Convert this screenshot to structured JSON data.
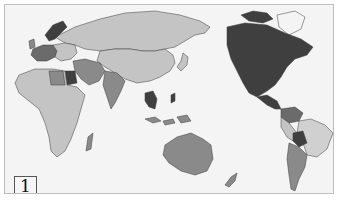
{
  "map": {
    "panel_label": "1",
    "projection": "pacific-centered world map",
    "legend": null,
    "colors": {
      "ocean": "#f4f4f4",
      "light": "#c4c4c4",
      "lighter": "#d0d0d0",
      "medium": "#8a8a8a",
      "medium_dark": "#6b6b6b",
      "dark": "#3f3f3f",
      "border": "#3a3a3a"
    },
    "regions": [
      {
        "name": "North America (Canada, USA, Mexico)",
        "shade": "dark"
      },
      {
        "name": "Greenland",
        "shade": "ocean"
      },
      {
        "name": "Central America",
        "shade": "dark"
      },
      {
        "name": "Colombia / Venezuela",
        "shade": "medium_dark"
      },
      {
        "name": "Brazil",
        "shade": "lighter"
      },
      {
        "name": "Bolivia",
        "shade": "dark"
      },
      {
        "name": "Argentina / Chile",
        "shade": "medium"
      },
      {
        "name": "Russia / Northern Asia",
        "shade": "light"
      },
      {
        "name": "China",
        "shade": "light"
      },
      {
        "name": "India",
        "shade": "medium"
      },
      {
        "name": "Thailand / Indochina",
        "shade": "dark"
      },
      {
        "name": "Australia",
        "shade": "medium"
      },
      {
        "name": "New Zealand",
        "shade": "medium"
      },
      {
        "name": "Scandinavia",
        "shade": "dark"
      },
      {
        "name": "Western Europe",
        "shade": "medium_dark"
      },
      {
        "name": "Egypt",
        "shade": "dark"
      },
      {
        "name": "Africa",
        "shade": "light"
      },
      {
        "name": "Madagascar",
        "shade": "medium"
      },
      {
        "name": "Middle East",
        "shade": "medium"
      }
    ]
  }
}
